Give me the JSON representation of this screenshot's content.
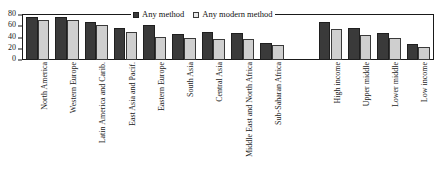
{
  "chart_data": {
    "type": "bar",
    "title": "",
    "subtitle": "",
    "xlabel": "",
    "ylabel": "",
    "ylim": [
      0,
      80
    ],
    "yticks": [
      0,
      20,
      40,
      60,
      80
    ],
    "grid": false,
    "legend_position": "top-center",
    "categories": [
      "North America",
      "Western Europe",
      "Latin America and Carib.",
      "East Asia and Pacif.",
      "Eastern Europe",
      "South Asia",
      "Central Asia",
      "Middle East and North Africa",
      "Sub-Saharan Africa",
      "High income",
      "Upper middle",
      "Lower middle",
      "Low income"
    ],
    "group_break_after": "Sub-Saharan Africa",
    "series": [
      {
        "name": "Any method",
        "color": "#3a3a3a",
        "values": [
          76,
          76,
          67,
          57,
          62,
          47,
          49,
          48,
          30,
          68,
          57,
          48,
          28
        ]
      },
      {
        "name": "Any modern method",
        "color": "#cfcfcf",
        "values": [
          71,
          71,
          62,
          49,
          41,
          40,
          38,
          38,
          26,
          56,
          45,
          39,
          23
        ]
      }
    ]
  },
  "legend": {
    "items": [
      {
        "label": "Any method",
        "swatch": "dark-square-icon"
      },
      {
        "label": "Any modern method",
        "swatch": "light-square-icon"
      }
    ]
  },
  "axis": {
    "y_tick_labels": [
      "80",
      "60",
      "40",
      "20",
      "0"
    ]
  }
}
